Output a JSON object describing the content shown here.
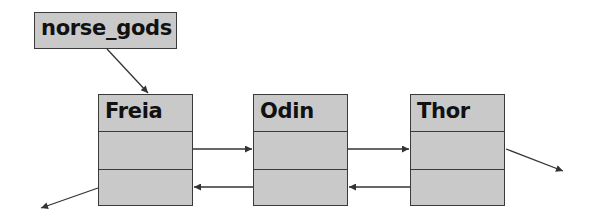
{
  "head": {
    "label": "norse_gods"
  },
  "nodes": [
    {
      "label": "Freia"
    },
    {
      "label": "Odin"
    },
    {
      "label": "Thor"
    }
  ],
  "colors": {
    "box_fill": "#c9c9c9",
    "box_border": "#3a3a3a",
    "arrow": "#333333",
    "text": "#111111"
  }
}
